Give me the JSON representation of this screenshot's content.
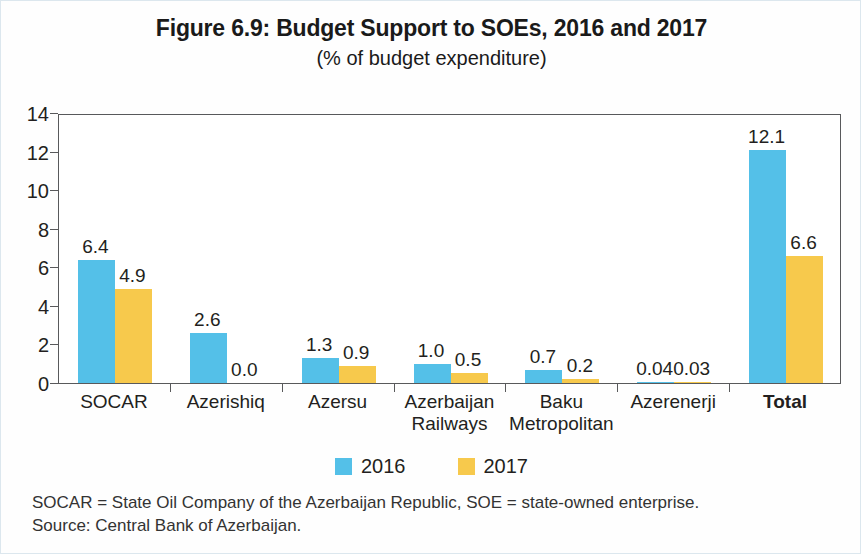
{
  "figure": {
    "title": "Figure 6.9: Budget Support to SOEs, 2016 and 2017",
    "subtitle": "(% of budget expenditure)"
  },
  "notes": {
    "abbreviations": "SOCAR = State Oil Company of the Azerbaijan Republic, SOE = state-owned enterprise.",
    "source": "Source: Central Bank of Azerbaijan."
  },
  "colors": {
    "series_2016": "#54c0e8",
    "series_2017": "#f7c94c",
    "axis": "#58595b",
    "text": "#231f20",
    "frame": "#dce7ee"
  },
  "chart_data": {
    "type": "bar",
    "title": "Figure 6.9: Budget Support to SOEs, 2016 and 2017",
    "subtitle": "(% of budget expenditure)",
    "xlabel": "",
    "ylabel": "",
    "ylim": [
      0,
      14
    ],
    "ytick_values": [
      0,
      2,
      4,
      6,
      8,
      10,
      12,
      14
    ],
    "ytick_labels": [
      "0",
      "2",
      "4",
      "6",
      "8",
      "10",
      "12",
      "14"
    ],
    "grid": false,
    "legend_position": "bottom-center",
    "categories": [
      "SOCAR",
      "Azerishiq",
      "Azersu",
      "Azerbaijan Railways",
      "Baku Metropolitan",
      "Azerenerji",
      "Total"
    ],
    "category_lines": [
      [
        "SOCAR"
      ],
      [
        "Azerishiq"
      ],
      [
        "Azersu"
      ],
      [
        "Azerbaijan",
        "Railways"
      ],
      [
        "Baku",
        "Metropolitan"
      ],
      [
        "Azerenerji"
      ],
      [
        "Total"
      ]
    ],
    "series": [
      {
        "name": "2016",
        "color": "#54c0e8",
        "values": [
          6.4,
          2.6,
          1.3,
          1.0,
          0.7,
          0.04,
          12.1
        ],
        "labels": [
          "6.4",
          "2.6",
          "1.3",
          "1.0",
          "0.7",
          "0.04",
          "12.1"
        ]
      },
      {
        "name": "2017",
        "color": "#f7c94c",
        "values": [
          4.9,
          0.0,
          0.9,
          0.5,
          0.2,
          0.03,
          6.6
        ],
        "labels": [
          "4.9",
          "0.0",
          "0.9",
          "0.5",
          "0.2",
          "0.03",
          "6.6"
        ]
      }
    ]
  }
}
